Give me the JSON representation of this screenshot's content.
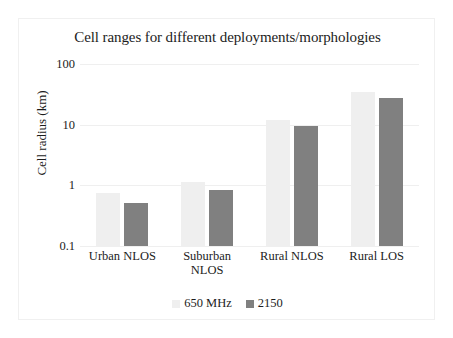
{
  "chart_data": {
    "type": "bar",
    "title": "Cell ranges for different deployments/morphologies",
    "xlabel": "",
    "ylabel": "Cell radius (km)",
    "yscale": "log",
    "ylim": [
      0.1,
      100
    ],
    "yticks": [
      "0.1",
      "1",
      "10",
      "100"
    ],
    "grid": true,
    "legend_position": "bottom",
    "categories": [
      "Urban NLOS",
      "Suburban NLOS",
      "Rural NLOS",
      "Rural LOS"
    ],
    "category_lines": [
      [
        "Urban NLOS"
      ],
      [
        "Suburban",
        "NLOS"
      ],
      [
        "Rural NLOS"
      ],
      [
        "Rural LOS"
      ]
    ],
    "series": [
      {
        "name": "650 MHz",
        "color": "#efefef",
        "values": [
          0.75,
          1.15,
          12,
          35
        ]
      },
      {
        "name": "2150",
        "color": "#808080",
        "values": [
          0.52,
          0.85,
          9.5,
          28
        ]
      }
    ]
  },
  "colors": {
    "series_light": "#efefef",
    "series_dark": "#808080",
    "gridline": "#efefef",
    "text": "#1c1c1c",
    "frame": "#f0f0f0"
  }
}
